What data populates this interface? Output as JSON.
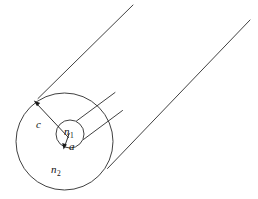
{
  "figure": {
    "type": "diagram",
    "background_color": "#ffffff",
    "line_color": "#2b2b2b",
    "text_color": "#111111",
    "labels": {
      "core_index": "n",
      "core_index_sub": "1",
      "cladding_index": "n",
      "cladding_index_sub": "2",
      "core_radius": "a",
      "cladding_radius": "c"
    },
    "geometry": {
      "outer_circle": {
        "cx": 64.5,
        "cy": 141.5,
        "r": 48.5
      },
      "inner_circle": {
        "cx": 70.0,
        "cy": 134.0,
        "r": 14.0
      },
      "cylinder_top_line": {
        "x1": 38.0,
        "y1": 98.5,
        "x2": 133.0,
        "y2": 5.0
      },
      "cylinder_bottom_line": {
        "x1": 107.5,
        "y1": 168.5,
        "x2": 250.0,
        "y2": 20.0
      },
      "core_top_line": {
        "x1": 76.0,
        "y1": 121.5,
        "x2": 114.0,
        "y2": 94.0
      },
      "core_bottom_line": {
        "x1": 83.0,
        "y1": 139.0,
        "x2": 121.0,
        "y2": 110.0
      },
      "arrow_c": {
        "x1": 68.5,
        "y1": 137.5,
        "x2": 34.0,
        "y2": 101.0
      },
      "arrow_a": {
        "x1": 69.0,
        "y1": 134.0,
        "x2": 63.5,
        "y2": 150.0
      }
    }
  }
}
